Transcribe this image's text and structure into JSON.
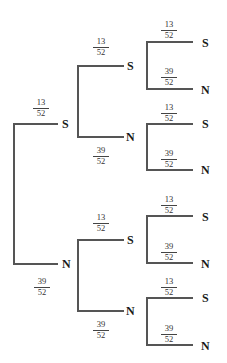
{
  "diagram": {
    "type": "probability-tree",
    "root": {
      "branches": [
        {
          "label": "S",
          "prob": {
            "num": "13",
            "den": "52"
          },
          "branches": [
            {
              "label": "S",
              "prob": {
                "num": "13",
                "den": "52"
              },
              "branches": [
                {
                  "label": "S",
                  "prob": {
                    "num": "13",
                    "den": "52"
                  }
                },
                {
                  "label": "N",
                  "prob": {
                    "num": "39",
                    "den": "52"
                  }
                }
              ]
            },
            {
              "label": "N",
              "prob": {
                "num": "39",
                "den": "52"
              },
              "branches": [
                {
                  "label": "S",
                  "prob": {
                    "num": "13",
                    "den": "52"
                  }
                },
                {
                  "label": "N",
                  "prob": {
                    "num": "39",
                    "den": "52"
                  }
                }
              ]
            }
          ]
        },
        {
          "label": "N",
          "prob": {
            "num": "39",
            "den": "52"
          },
          "branches": [
            {
              "label": "S",
              "prob": {
                "num": "13",
                "den": "52"
              },
              "branches": [
                {
                  "label": "S",
                  "prob": {
                    "num": "13",
                    "den": "52"
                  }
                },
                {
                  "label": "N",
                  "prob": {
                    "num": "39",
                    "den": "52"
                  }
                }
              ]
            },
            {
              "label": "N",
              "prob": {
                "num": "39",
                "den": "52"
              },
              "branches": [
                {
                  "label": "S",
                  "prob": {
                    "num": "13",
                    "den": "52"
                  }
                },
                {
                  "label": "N",
                  "prob": {
                    "num": "39",
                    "den": "52"
                  }
                }
              ]
            }
          ]
        }
      ]
    }
  },
  "colors": {
    "line": "#555555",
    "text": "#1a1a1a",
    "background": "#ffffff"
  }
}
